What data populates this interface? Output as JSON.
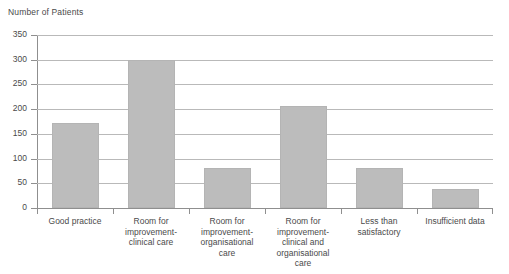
{
  "chart_data": {
    "type": "bar",
    "title": "Number of Patients",
    "xlabel": "",
    "ylabel": "",
    "ylim": [
      0,
      350
    ],
    "ytick_step": 50,
    "yticks": [
      0,
      50,
      100,
      150,
      200,
      250,
      300,
      350
    ],
    "ytick_labels": [
      "0",
      "50",
      "100",
      "150",
      "200",
      "250",
      "300",
      "350"
    ],
    "grid": true,
    "legend": false,
    "legend_position": "none",
    "bar_color": "#bcbcbc",
    "categories": [
      "Good practice",
      "Room for improvement - clinical care",
      "Room for improvement - organisational care",
      "Room for improvement - clinical and organisational care",
      "Less than satisfactory",
      "Insufficient data"
    ],
    "category_label_lines": [
      [
        "Good practice"
      ],
      [
        "Room for",
        "improvement-",
        "clinical care"
      ],
      [
        "Room for",
        "improvement-",
        "organisational",
        "care"
      ],
      [
        "Room for",
        "improvement-",
        "clinical and",
        "organisational",
        "care"
      ],
      [
        "Less than",
        "satisfactory"
      ],
      [
        "Insufficient data"
      ]
    ],
    "values": [
      172,
      300,
      80,
      207,
      80,
      38
    ]
  }
}
